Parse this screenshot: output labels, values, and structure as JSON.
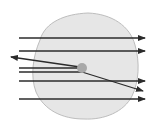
{
  "diagram": {
    "title": "",
    "colors": {
      "atom_fill": "#e6e6e6",
      "atom_stroke": "#bdbdbd",
      "nucleus_fill": "#a8a8a8",
      "ray_color": "#2b2b2b"
    },
    "atom": {
      "cx": 83,
      "cy": 67,
      "rx": 52,
      "ry": 56
    },
    "nucleus": {
      "cx": 82,
      "cy": 68,
      "r": 5
    },
    "rays": [
      {
        "id": "ray-1",
        "x1": 19,
        "y1": 38,
        "x2": 145,
        "y2": 38,
        "arrow": "end"
      },
      {
        "id": "ray-2",
        "x1": 19,
        "y1": 51,
        "x2": 145,
        "y2": 51,
        "arrow": "end"
      },
      {
        "id": "ray-3-reflected",
        "x1": 80,
        "y1": 67,
        "x2": 11,
        "y2": 57,
        "arrow": "end"
      },
      {
        "id": "ray-3-incoming",
        "x1": 19,
        "y1": 68,
        "x2": 80,
        "y2": 68,
        "arrow": "none"
      },
      {
        "id": "ray-4-incoming",
        "x1": 19,
        "y1": 72,
        "x2": 82,
        "y2": 72,
        "arrow": "none"
      },
      {
        "id": "ray-4-deflected",
        "x1": 82,
        "y1": 72,
        "x2": 143,
        "y2": 91,
        "arrow": "end"
      },
      {
        "id": "ray-5",
        "x1": 19,
        "y1": 81,
        "x2": 145,
        "y2": 81,
        "arrow": "end"
      },
      {
        "id": "ray-6",
        "x1": 19,
        "y1": 99,
        "x2": 145,
        "y2": 99,
        "arrow": "end"
      }
    ]
  }
}
